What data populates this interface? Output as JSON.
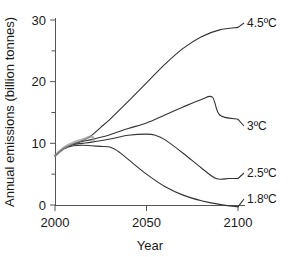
{
  "chart_data": {
    "type": "line",
    "title": "",
    "xlabel": "Year",
    "ylabel": "Annual emissions (billion tonnes)",
    "xlim": [
      2000,
      2100
    ],
    "ylim": [
      0,
      30
    ],
    "xticks": [
      "2000",
      "2050",
      "2100"
    ],
    "xtick_values": [
      2000,
      2050,
      2100
    ],
    "yticks": [
      "0",
      "10",
      "20",
      "30"
    ],
    "ytick_values": [
      0,
      10,
      20,
      30
    ],
    "minor_ytick_values": [
      5,
      15,
      25
    ],
    "grid": false,
    "legend_position": "right-inline-end-of-line",
    "series": [
      {
        "name": "4.5ºC",
        "label_value": "4.5",
        "label_unit": "ºC",
        "color": "#333333",
        "x": [
          2000,
          2005,
          2010,
          2015,
          2020,
          2025,
          2030,
          2040,
          2050,
          2060,
          2070,
          2080,
          2090,
          2100
        ],
        "values": [
          8.0,
          9.2,
          9.9,
          10.4,
          11.3,
          12.6,
          13.9,
          16.8,
          19.8,
          22.8,
          25.4,
          27.3,
          28.4,
          28.8
        ]
      },
      {
        "name": "3ºC",
        "label_value": "3",
        "label_unit": "ºC",
        "color": "#333333",
        "x": [
          2000,
          2005,
          2010,
          2015,
          2020,
          2030,
          2040,
          2050,
          2060,
          2070,
          2080,
          2086,
          2090,
          2100
        ],
        "values": [
          8.0,
          9.2,
          9.9,
          10.3,
          10.6,
          11.4,
          12.4,
          13.3,
          14.6,
          15.9,
          17.1,
          17.5,
          14.6,
          13.9
        ]
      },
      {
        "name": "2.5ºC",
        "label_value": "2.5",
        "label_unit": "ºC",
        "color": "#333333",
        "x": [
          2000,
          2005,
          2010,
          2015,
          2020,
          2030,
          2040,
          2050,
          2055,
          2060,
          2070,
          2080,
          2088,
          2095,
          2100
        ],
        "values": [
          8.0,
          9.2,
          9.8,
          10.0,
          10.2,
          10.7,
          11.3,
          11.5,
          11.3,
          10.6,
          8.4,
          6.0,
          4.3,
          4.3,
          4.3
        ]
      },
      {
        "name": "1.8ºC",
        "label_value": "1.8",
        "label_unit": "ºC",
        "color": "#333333",
        "x": [
          2000,
          2005,
          2010,
          2015,
          2020,
          2025,
          2030,
          2035,
          2040,
          2050,
          2060,
          2070,
          2080,
          2090,
          2100
        ],
        "values": [
          8.0,
          9.1,
          9.6,
          9.7,
          9.6,
          9.5,
          9.4,
          8.6,
          7.4,
          5.0,
          3.0,
          1.6,
          0.7,
          0.1,
          -0.3
        ]
      },
      {
        "name": "historical",
        "label_value": "",
        "label_unit": "",
        "color": "#9a9a9a",
        "x": [
          2000,
          2005,
          2010,
          2015,
          2020,
          2021
        ],
        "values": [
          8.0,
          9.3,
          10.1,
          10.6,
          11.1,
          10.5
        ]
      }
    ]
  },
  "axes": {
    "x_axis_name": "Year",
    "y_axis_name": "Annual emissions (billion tonnes)"
  }
}
